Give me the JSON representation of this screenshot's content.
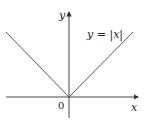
{
  "diagram": {
    "x_axis_label": "x",
    "y_axis_label": "y",
    "origin_label": "0",
    "function_label": "y = |x|",
    "function": "abs",
    "colors": {
      "axes": "#333333",
      "curve": "#444444"
    }
  }
}
